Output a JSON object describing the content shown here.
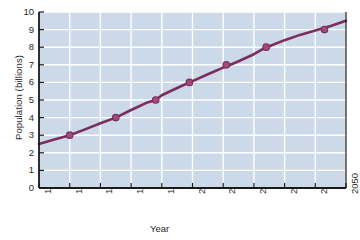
{
  "chart_data": {
    "type": "line",
    "title": "",
    "xlabel": "Year",
    "ylabel": "Population (billions)",
    "xlim": [
      1950,
      2050
    ],
    "ylim": [
      0,
      10
    ],
    "xticks": [
      "1950",
      "1960",
      "1970",
      "1980",
      "1990",
      "2000",
      "2010",
      "2020",
      "2030",
      "2040",
      "2050"
    ],
    "yticks": [
      "0",
      "1",
      "2",
      "3",
      "4",
      "5",
      "6",
      "7",
      "8",
      "9",
      "10"
    ],
    "grid": true,
    "legend": "none",
    "line_color": "#7b2d5e",
    "marker_color": "#a04a78",
    "plot_background": "#ccd9e8",
    "gridline_color": "#ffffff",
    "axis_color": "#1a1a1a",
    "x": [
      1950,
      1955,
      1960,
      1965,
      1970,
      1975,
      1980,
      1985,
      1988,
      1990,
      1995,
      1999,
      2000,
      2005,
      2010,
      2011,
      2015,
      2020,
      2024,
      2025,
      2030,
      2035,
      2040,
      2043,
      2045,
      2050
    ],
    "values": [
      2.5,
      2.75,
      3.0,
      3.33,
      3.68,
      4.0,
      4.43,
      4.84,
      5.0,
      5.27,
      5.68,
      6.0,
      6.07,
      6.46,
      6.84,
      6.9,
      7.2,
      7.6,
      8.0,
      8.05,
      8.4,
      8.7,
      8.95,
      9.1,
      9.2,
      9.5
    ],
    "markers": [
      {
        "x": 1960,
        "y": 3.0
      },
      {
        "x": 1975,
        "y": 4.0
      },
      {
        "x": 1988,
        "y": 5.0
      },
      {
        "x": 1999,
        "y": 6.0
      },
      {
        "x": 2011,
        "y": 7.0
      },
      {
        "x": 2024,
        "y": 8.0
      },
      {
        "x": 2043,
        "y": 9.0
      }
    ]
  }
}
